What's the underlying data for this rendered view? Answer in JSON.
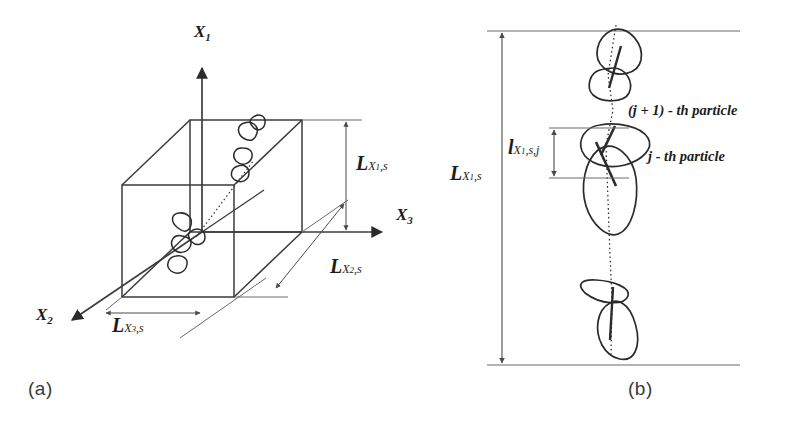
{
  "figure": {
    "panels": [
      {
        "id": "a",
        "caption": "(a)",
        "axes": [
          {
            "name": "axis-x1",
            "base": "X",
            "sub": "1"
          },
          {
            "name": "axis-x2",
            "base": "X",
            "sub": "2"
          },
          {
            "name": "axis-x3",
            "base": "X",
            "sub": "3"
          }
        ],
        "dimensions": [
          {
            "name": "length-x1-s",
            "base": "L",
            "sub": "X",
            "subsub": "1",
            "suffix": ",s"
          },
          {
            "name": "length-x2-s",
            "base": "L",
            "sub": "X",
            "subsub": "2",
            "suffix": ",s"
          },
          {
            "name": "length-x3-s",
            "base": "L",
            "sub": "X",
            "subsub": "3",
            "suffix": ",s"
          }
        ]
      },
      {
        "id": "b",
        "caption": "(b)",
        "dimensions": [
          {
            "name": "total-length-x1-s",
            "base": "L",
            "sub": "X",
            "subsub": "1",
            "suffix": ",s"
          },
          {
            "name": "particle-length-x1-s-j",
            "base": "l",
            "sub": "X",
            "subsub": "1",
            "suffix": ",s,j"
          }
        ],
        "annotations": [
          {
            "name": "particle-j-plus-1-label",
            "text": "(j + 1) - th  particle"
          },
          {
            "name": "particle-j-label",
            "text": "j - th  particle"
          }
        ]
      }
    ]
  }
}
